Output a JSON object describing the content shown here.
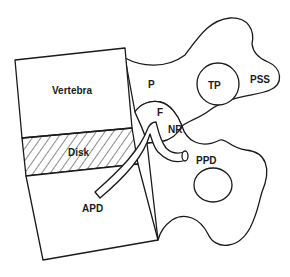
{
  "diagram": {
    "type": "anatomical-schematic",
    "colors": {
      "stroke": "#1a1a1a",
      "background": "#ffffff"
    },
    "labels": {
      "vertebra": "Vertebra",
      "disk": "Disk",
      "apd": "APD",
      "p": "P",
      "tp": "TP",
      "pss": "PSS",
      "f": "F",
      "nr": "NR",
      "ppd": "PPD"
    },
    "structures": [
      {
        "id": "vertebra",
        "label": "Vertebra",
        "shape": "quadrilateral"
      },
      {
        "id": "disk",
        "label": "Disk",
        "fill": "hatched"
      },
      {
        "id": "lower-vertebra",
        "label": "APD",
        "shape": "quadrilateral"
      },
      {
        "id": "upper-process",
        "labels": [
          "P",
          "TP",
          "PSS"
        ]
      },
      {
        "id": "foramen",
        "label": "F"
      },
      {
        "id": "nerve-root",
        "label": "NR"
      },
      {
        "id": "lower-process",
        "label": "PPD"
      }
    ]
  }
}
